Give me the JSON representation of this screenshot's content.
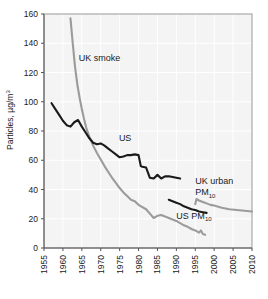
{
  "chart_data": {
    "type": "line",
    "title": "",
    "xlabel": "",
    "ylabel": "Particles, µg/m³",
    "xlim": [
      1955,
      2010
    ],
    "ylim": [
      0,
      160
    ],
    "grid": true,
    "legend_position": "inline-annotations",
    "x_ticks": [
      "1955",
      "1960",
      "1965",
      "1970",
      "1975",
      "1980",
      "1985",
      "1990",
      "1995",
      "2000",
      "2005",
      "2010"
    ],
    "y_ticks": [
      "0",
      "20",
      "40",
      "60",
      "80",
      "100",
      "120",
      "140",
      "160"
    ],
    "colors": {
      "dark": "#1a1a1a",
      "gray": "#9b9b9b",
      "plot_background": "#f4f4f4",
      "gridline": "#ffffff",
      "axis": "#555555"
    },
    "series": [
      {
        "name": "UK smoke",
        "color": "#9b9b9b",
        "label_x": 1964.2,
        "label_y": 128,
        "points": [
          [
            1962.0,
            157.0
          ],
          [
            1962.6,
            140.0
          ],
          [
            1963.2,
            124.0
          ],
          [
            1963.8,
            112.0
          ],
          [
            1964.4,
            103.0
          ],
          [
            1965.0,
            95.0
          ],
          [
            1965.6,
            88.0
          ],
          [
            1966.2,
            82.0
          ],
          [
            1967.0,
            76.0
          ],
          [
            1968.0,
            70.0
          ],
          [
            1969.0,
            65.0
          ],
          [
            1970.0,
            60.5
          ],
          [
            1971.0,
            56.0
          ],
          [
            1972.0,
            52.0
          ],
          [
            1973.0,
            48.0
          ],
          [
            1974.0,
            44.5
          ],
          [
            1975.0,
            41.0
          ],
          [
            1976.0,
            38.0
          ],
          [
            1977.0,
            35.5
          ],
          [
            1978.0,
            33.0
          ],
          [
            1979.0,
            32.0
          ],
          [
            1980.0,
            29.5
          ],
          [
            1981.0,
            28.0
          ],
          [
            1982.0,
            26.5
          ],
          [
            1983.0,
            23.5
          ],
          [
            1984.0,
            20.5
          ],
          [
            1985.0,
            22.0
          ],
          [
            1986.0,
            22.5
          ],
          [
            1987.0,
            21.5
          ],
          [
            1988.0,
            20.5
          ],
          [
            1989.0,
            19.5
          ],
          [
            1990.0,
            18.5
          ],
          [
            1991.0,
            17.0
          ],
          [
            1992.0,
            15.5
          ],
          [
            1993.0,
            14.5
          ],
          [
            1994.0,
            13.0
          ],
          [
            1995.0,
            12.0
          ],
          [
            1996.0,
            10.5
          ],
          [
            1996.5,
            12.0
          ],
          [
            1997.0,
            9.5
          ],
          [
            1997.6,
            9.0
          ]
        ]
      },
      {
        "name": "US",
        "color": "#1a1a1a",
        "label_x": 1974.5,
        "label_y": 73,
        "points": [
          [
            1957.0,
            99.0
          ],
          [
            1958.0,
            95.0
          ],
          [
            1959.0,
            91.0
          ],
          [
            1960.0,
            87.0
          ],
          [
            1961.0,
            84.0
          ],
          [
            1962.0,
            83.0
          ],
          [
            1963.0,
            86.0
          ],
          [
            1964.0,
            87.5
          ],
          [
            1965.0,
            83.0
          ],
          [
            1966.0,
            79.0
          ],
          [
            1967.0,
            75.0
          ],
          [
            1968.0,
            72.0
          ],
          [
            1969.0,
            71.0
          ],
          [
            1970.0,
            71.5
          ],
          [
            1971.0,
            70.0
          ],
          [
            1972.0,
            68.0
          ],
          [
            1973.0,
            66.0
          ],
          [
            1974.0,
            64.0
          ],
          [
            1975.0,
            62.0
          ],
          [
            1976.0,
            62.5
          ],
          [
            1977.0,
            63.5
          ],
          [
            1978.0,
            63.5
          ],
          [
            1979.0,
            64.0
          ],
          [
            1980.0,
            63.5
          ],
          [
            1980.6,
            56.0
          ],
          [
            1981.0,
            55.5
          ],
          [
            1982.0,
            55.0
          ],
          [
            1983.0,
            48.0
          ],
          [
            1984.0,
            47.5
          ],
          [
            1985.0,
            50.0
          ],
          [
            1986.0,
            47.5
          ],
          [
            1987.0,
            49.0
          ],
          [
            1988.0,
            49.0
          ],
          [
            1989.0,
            48.5
          ],
          [
            1990.0,
            48.0
          ],
          [
            1991.0,
            47.5
          ]
        ]
      },
      {
        "name": "US PM10",
        "color": "#1a1a1a",
        "label_x": 1988.5,
        "label_y": 20,
        "points": [
          [
            1988.0,
            33.0
          ],
          [
            1989.0,
            32.0
          ],
          [
            1990.0,
            31.0
          ],
          [
            1991.0,
            30.0
          ],
          [
            1992.0,
            28.5
          ],
          [
            1993.0,
            27.5
          ],
          [
            1994.0,
            26.5
          ],
          [
            1995.0,
            26.0
          ],
          [
            1996.0,
            25.0
          ],
          [
            1997.0,
            24.5
          ],
          [
            1998.0,
            24.0
          ]
        ]
      },
      {
        "name": "UK urban PM10",
        "color": "#9b9b9b",
        "label_x": 1994.0,
        "label_y": 42,
        "points": [
          [
            1995.0,
            30.0
          ],
          [
            1995.3,
            33.5
          ],
          [
            1996.0,
            32.5
          ],
          [
            1997.0,
            31.5
          ],
          [
            1998.0,
            30.5
          ],
          [
            1999.0,
            29.5
          ],
          [
            2000.0,
            29.0
          ],
          [
            2002.0,
            27.5
          ],
          [
            2004.0,
            26.5
          ],
          [
            2006.0,
            26.0
          ],
          [
            2008.0,
            25.5
          ],
          [
            2010.0,
            25.0
          ]
        ]
      }
    ],
    "annotations": [
      {
        "text": "UK smoke",
        "x": 1964.2,
        "y": 128
      },
      {
        "text": "US",
        "x": 1974.8,
        "y": 73
      },
      {
        "text": "UK urban",
        "x": 1995.0,
        "y": 44
      },
      {
        "text": "PM",
        "sub": "10",
        "x": 1995.0,
        "y": 36
      },
      {
        "text": "US PM",
        "sub": "10",
        "x": 1990.0,
        "y": 20
      }
    ]
  },
  "labels": {
    "ylabel_main": "Particles, µg/m",
    "ylabel_exp": "3",
    "ann_uk_smoke": "UK smoke",
    "ann_us": "US",
    "ann_uk_urban": "UK urban",
    "ann_pm": "PM",
    "ann_pm_sub": "10",
    "ann_us_pm": "US PM",
    "ann_us_pm_sub": "10"
  }
}
